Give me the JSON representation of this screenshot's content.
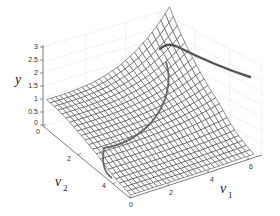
{
  "chart_data": {
    "type": "surface",
    "title": "",
    "xlabel": "v1",
    "ylabel": "v2",
    "zlabel": "y",
    "x_ticks": [
      "0",
      "2",
      "4",
      "6"
    ],
    "y_ticks": [
      "0",
      "2",
      "4"
    ],
    "z_ticks": [
      "0",
      "0.5",
      "1",
      "1.5",
      "2",
      "2.5",
      "3"
    ],
    "xlim": [
      0,
      7
    ],
    "ylim": [
      0,
      5
    ],
    "zlim": [
      0,
      3
    ],
    "grid": true,
    "mesh_color": "#333333",
    "highlight_color": "#555555",
    "surface_samples": {
      "v1": [
        0,
        2,
        4,
        6,
        7
      ],
      "v2": [
        0,
        1,
        2,
        3,
        4,
        5
      ],
      "y": [
        [
          1.0,
          0.95,
          0.85,
          0.7,
          0.5,
          0.3
        ],
        [
          1.2,
          1.0,
          0.8,
          0.5,
          0.3,
          0.15
        ],
        [
          1.6,
          1.2,
          0.8,
          0.4,
          0.2,
          0.1
        ],
        [
          2.6,
          1.8,
          1.0,
          0.5,
          0.2,
          0.1
        ],
        [
          2.2,
          1.6,
          1.0,
          0.5,
          0.2,
          0.1
        ]
      ]
    }
  },
  "labels": {
    "z_axis": "y",
    "y_axis_main": "v",
    "y_axis_sub": "2",
    "x_axis_main": "v",
    "x_axis_sub": "1"
  },
  "ticks": {
    "z": [
      "3",
      "2.5",
      "2",
      "1.5",
      "1",
      "0.5",
      "0"
    ],
    "v2": [
      "0",
      "2",
      "4"
    ],
    "v1": [
      "0",
      "2",
      "4",
      "6"
    ]
  }
}
